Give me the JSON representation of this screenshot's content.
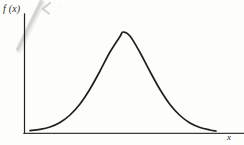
{
  "figure": {
    "kind": "scanned-textbook-figure",
    "background_color": "#fdfdfb",
    "ink_color": "#1f1f1f",
    "artifact_color": "#c9c9c6",
    "y_axis_label": "f (x)",
    "x_axis_label": "x"
  },
  "chart_data": {
    "type": "line",
    "title": "",
    "subtitle": "",
    "xlabel": "x",
    "ylabel": "f (x)",
    "legend": [],
    "legend_position": "none",
    "grid": false,
    "annotations": [],
    "tick_labels": {
      "x": [],
      "y": []
    },
    "xlim": [
      24,
      244
    ],
    "ylim": [
      32,
      133
    ],
    "axes": {
      "y_axis_x_px": 24,
      "y_axis_top_px": 14,
      "y_axis_bottom_px": 133,
      "x_axis_y_px": 133,
      "x_axis_left_px": 24,
      "x_axis_right_px": 244
    },
    "curve": {
      "name": "bell-curve",
      "description": "symmetric unimodal probability density function",
      "peak_x_px": 123,
      "peak_y_px": 32,
      "baseline_y_px": 131,
      "left_tail_x_px": 30,
      "right_tail_x_px": 216,
      "x": [
        30,
        40,
        50,
        60,
        70,
        80,
        90,
        100,
        110,
        120,
        123,
        130,
        140,
        150,
        160,
        170,
        180,
        190,
        200,
        210,
        216
      ],
      "values": [
        130.6,
        129.4,
        127.0,
        122.5,
        115.0,
        104.0,
        89.0,
        71.0,
        52.0,
        36.5,
        32.0,
        36.0,
        52.5,
        71.5,
        89.5,
        104.5,
        115.5,
        123.0,
        127.5,
        130.0,
        131.0
      ]
    },
    "scan_artifacts": [
      {
        "name": "diagonal-smudge",
        "x1": 18,
        "y1": 49,
        "x2": 41,
        "y2": 2,
        "width": 3.5,
        "color": "#c9c9c6"
      },
      {
        "name": "check-mark-smudge",
        "x1": 50,
        "y1": 4,
        "x2": 43,
        "y2": 9,
        "x3": 49,
        "y3": 13,
        "width": 2,
        "color": "#cfcfcb"
      }
    ]
  }
}
